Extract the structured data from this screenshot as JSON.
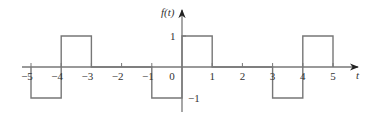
{
  "figure": {
    "title": "",
    "y_axis_label": "f(t)",
    "x_axis_label": "t",
    "x_tick_labels": [
      "−5",
      "−4",
      "−3",
      "−2",
      "−1",
      "0",
      "1",
      "2",
      "3",
      "4",
      "5"
    ],
    "y_tick_labels": [
      "1",
      "−1"
    ],
    "colors": {
      "line": "#777777",
      "text": "#333333",
      "background": "#ffffff"
    }
  },
  "chart_data": {
    "type": "line",
    "title": "",
    "xlabel": "t",
    "ylabel": "f(t)",
    "xlim": [
      -5,
      5
    ],
    "ylim": [
      -1,
      1
    ],
    "grid": false,
    "segments": [
      {
        "t_start": -5,
        "t_end": -4,
        "value": -1
      },
      {
        "t_start": -4,
        "t_end": -3,
        "value": 1
      },
      {
        "t_start": -3,
        "t_end": -1,
        "value": 0
      },
      {
        "t_start": -1,
        "t_end": 0,
        "value": -1
      },
      {
        "t_start": 0,
        "t_end": 1,
        "value": 1
      },
      {
        "t_start": 1,
        "t_end": 3,
        "value": 0
      },
      {
        "t_start": 3,
        "t_end": 4,
        "value": -1
      },
      {
        "t_start": 4,
        "t_end": 5,
        "value": 1
      }
    ],
    "x_ticks": [
      -5,
      -4,
      -3,
      -2,
      -1,
      0,
      1,
      2,
      3,
      4,
      5
    ],
    "y_ticks": [
      1,
      -1
    ]
  }
}
